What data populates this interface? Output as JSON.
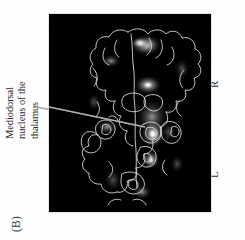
{
  "figure": {
    "panel_letter": "(B)",
    "annotation": {
      "lines": [
        "Mediodorsal",
        "nucleus of the",
        "thalamus"
      ],
      "full_text": "Mediodorsal nucleus of the thalamus"
    },
    "orientation_labels": {
      "right": "R",
      "left": "L"
    },
    "image": {
      "modality": "coronal brain section with statistical activation overlay",
      "background_color": "#000000",
      "outline_color": "#d8d8d8",
      "hotspot_color": "#ffffff",
      "leader_line_color": "#b9b9b9",
      "rotation": "90deg counter-clockwise"
    }
  }
}
